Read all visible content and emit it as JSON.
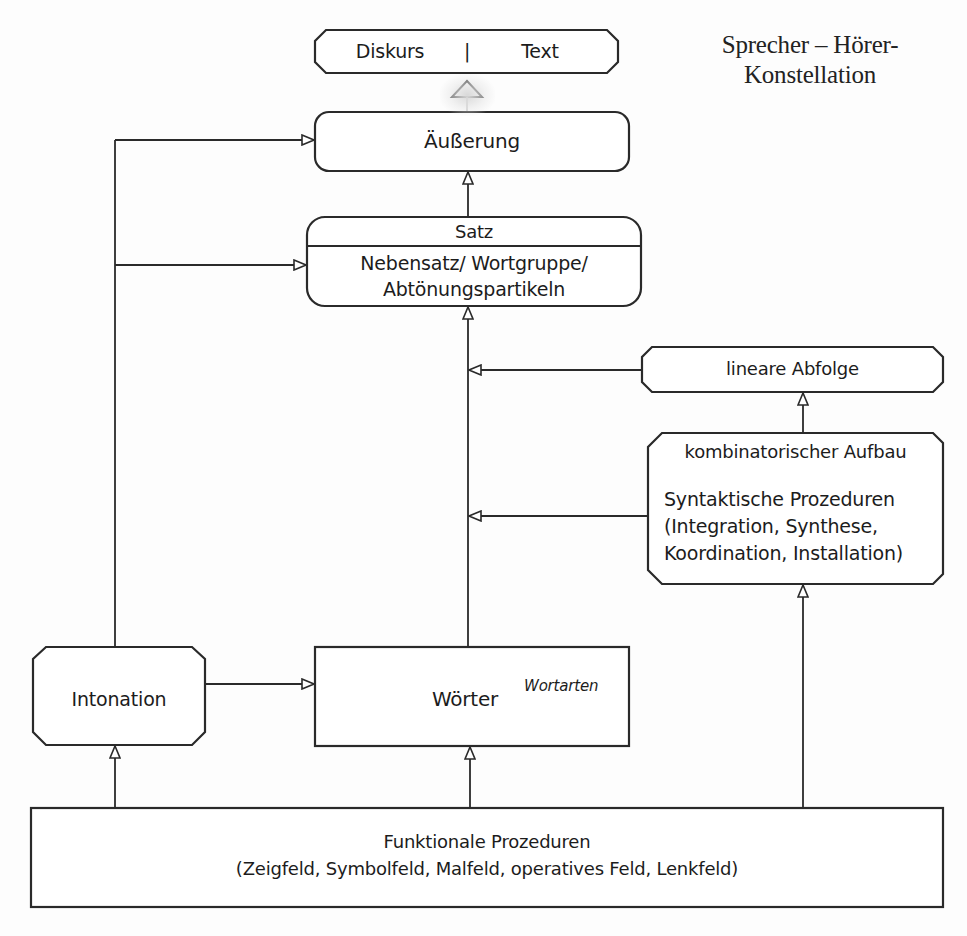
{
  "title": {
    "line1": "Sprecher – Hörer-",
    "line2": "Konstellation"
  },
  "nodes": {
    "diskurs_text": {
      "left": "Diskurs",
      "separator": "|",
      "right": "Text"
    },
    "aeusserung": {
      "label": "Äußerung"
    },
    "satz": {
      "header": "Satz",
      "line1": "Nebensatz/ Wortgruppe/",
      "line2": "Abtönungspartikeln"
    },
    "lineare_abfolge": {
      "label": "lineare Abfolge"
    },
    "kombinatorischer_aufbau": {
      "header": "kombinatorischer Aufbau",
      "line1": "Syntaktische Prozeduren",
      "line2": "(Integration, Synthese,",
      "line3": "Koordination, Installation)"
    },
    "intonation": {
      "label": "Intonation"
    },
    "woerter": {
      "label": "Wörter",
      "annotation": "Wortarten"
    },
    "funktionale_prozeduren": {
      "line1": "Funktionale Prozeduren",
      "line2": "(Zeigfeld, Symbolfeld, Malfeld, operatives Feld, Lenkfeld)"
    }
  },
  "edges": [
    {
      "from": "aeusserung",
      "to": "diskurs_text",
      "arrow": "open-triangle"
    },
    {
      "from": "satz",
      "to": "aeusserung",
      "arrow": "open-triangle"
    },
    {
      "from": "woerter",
      "to": "satz",
      "arrow": "open-triangle"
    },
    {
      "from": "lineare_abfolge",
      "to": "woerter-satz-line",
      "arrow": "open-triangle"
    },
    {
      "from": "kombinatorischer_aufbau",
      "to": "lineare_abfolge",
      "arrow": "open-triangle"
    },
    {
      "from": "kombinatorischer_aufbau",
      "to": "woerter-satz-line",
      "arrow": "open-triangle"
    },
    {
      "from": "intonation",
      "to": "aeusserung",
      "arrow": "open-triangle"
    },
    {
      "from": "intonation",
      "to": "satz",
      "arrow": "open-triangle"
    },
    {
      "from": "intonation",
      "to": "woerter",
      "arrow": "open-triangle"
    },
    {
      "from": "funktionale_prozeduren",
      "to": "intonation",
      "arrow": "open-triangle"
    },
    {
      "from": "funktionale_prozeduren",
      "to": "woerter",
      "arrow": "open-triangle"
    },
    {
      "from": "funktionale_prozeduren",
      "to": "kombinatorischer_aufbau",
      "arrow": "open-triangle"
    }
  ],
  "colors": {
    "stroke": "#2a2a2a",
    "text": "#1c1c1c",
    "background": "#fdfdfd"
  }
}
